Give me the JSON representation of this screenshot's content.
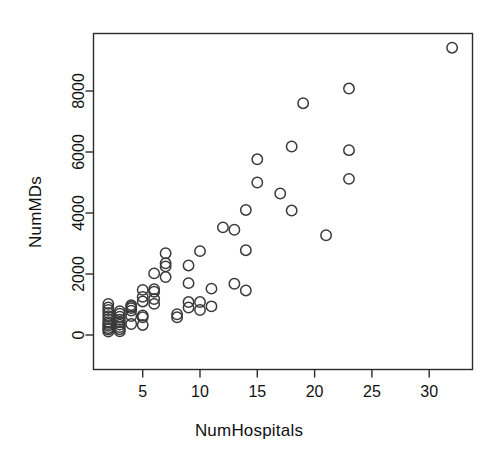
{
  "chart_data": {
    "type": "scatter",
    "title": "",
    "xlabel": "NumHospitals",
    "ylabel": "NumMDs",
    "xlim": [
      1,
      33
    ],
    "ylim": [
      -200,
      9800
    ],
    "xticks": [
      5,
      10,
      15,
      20,
      25,
      30
    ],
    "yticks": [
      0,
      2000,
      4000,
      6000,
      8000
    ],
    "xtick_labels": [
      "5",
      "10",
      "15",
      "20",
      "25",
      "30"
    ],
    "ytick_labels": [
      "0",
      "2000",
      "4000",
      "6000",
      "8000"
    ],
    "grid": false,
    "legend": null,
    "marker": {
      "shape": "circle",
      "fill": "none",
      "stroke": "#3a3a3a",
      "size": 5.2
    },
    "points": [
      {
        "x": 2,
        "y": 110
      },
      {
        "x": 2,
        "y": 180
      },
      {
        "x": 2,
        "y": 230
      },
      {
        "x": 2,
        "y": 300
      },
      {
        "x": 2,
        "y": 360
      },
      {
        "x": 2,
        "y": 420
      },
      {
        "x": 2,
        "y": 520
      },
      {
        "x": 2,
        "y": 620
      },
      {
        "x": 2,
        "y": 720
      },
      {
        "x": 2,
        "y": 820
      },
      {
        "x": 2,
        "y": 900
      },
      {
        "x": 2,
        "y": 1020
      },
      {
        "x": 3,
        "y": 120
      },
      {
        "x": 3,
        "y": 190
      },
      {
        "x": 3,
        "y": 260
      },
      {
        "x": 3,
        "y": 340
      },
      {
        "x": 3,
        "y": 420
      },
      {
        "x": 3,
        "y": 500
      },
      {
        "x": 3,
        "y": 600
      },
      {
        "x": 3,
        "y": 700
      },
      {
        "x": 3,
        "y": 780
      },
      {
        "x": 4,
        "y": 360
      },
      {
        "x": 4,
        "y": 620
      },
      {
        "x": 4,
        "y": 800
      },
      {
        "x": 4,
        "y": 880
      },
      {
        "x": 4,
        "y": 930
      },
      {
        "x": 4,
        "y": 980
      },
      {
        "x": 5,
        "y": 330
      },
      {
        "x": 5,
        "y": 580
      },
      {
        "x": 5,
        "y": 640
      },
      {
        "x": 5,
        "y": 1100
      },
      {
        "x": 5,
        "y": 1250
      },
      {
        "x": 5,
        "y": 1480
      },
      {
        "x": 6,
        "y": 1020
      },
      {
        "x": 6,
        "y": 1180
      },
      {
        "x": 6,
        "y": 1420
      },
      {
        "x": 6,
        "y": 1500
      },
      {
        "x": 6,
        "y": 2020
      },
      {
        "x": 7,
        "y": 1900
      },
      {
        "x": 7,
        "y": 2250
      },
      {
        "x": 7,
        "y": 2350
      },
      {
        "x": 7,
        "y": 2680
      },
      {
        "x": 8,
        "y": 580
      },
      {
        "x": 8,
        "y": 680
      },
      {
        "x": 9,
        "y": 900
      },
      {
        "x": 9,
        "y": 1080
      },
      {
        "x": 9,
        "y": 1700
      },
      {
        "x": 9,
        "y": 2280
      },
      {
        "x": 10,
        "y": 820
      },
      {
        "x": 10,
        "y": 1080
      },
      {
        "x": 10,
        "y": 2750
      },
      {
        "x": 11,
        "y": 940
      },
      {
        "x": 11,
        "y": 1520
      },
      {
        "x": 12,
        "y": 3530
      },
      {
        "x": 13,
        "y": 1680
      },
      {
        "x": 13,
        "y": 3450
      },
      {
        "x": 14,
        "y": 1460
      },
      {
        "x": 14,
        "y": 2780
      },
      {
        "x": 14,
        "y": 4100
      },
      {
        "x": 15,
        "y": 5000
      },
      {
        "x": 15,
        "y": 5760
      },
      {
        "x": 17,
        "y": 4640
      },
      {
        "x": 18,
        "y": 4080
      },
      {
        "x": 18,
        "y": 6180
      },
      {
        "x": 19,
        "y": 7600
      },
      {
        "x": 21,
        "y": 3270
      },
      {
        "x": 23,
        "y": 5120
      },
      {
        "x": 23,
        "y": 6060
      },
      {
        "x": 23,
        "y": 8080
      },
      {
        "x": 32,
        "y": 9420
      }
    ]
  },
  "axes": {
    "box_color": "#2b2b2b",
    "tick_color": "#2b2b2b"
  }
}
